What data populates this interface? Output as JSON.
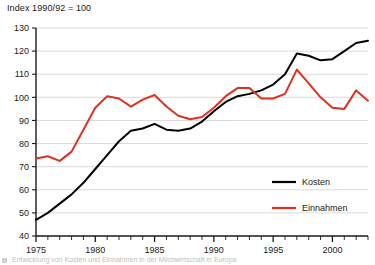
{
  "chart_title": "Index 1990/92 = 100",
  "caption": {
    "bullet_icon": "square-bullet-icon",
    "text": "Entwicklung von Kosten und Einnahmen in der Milchwirtschaft in Europa"
  },
  "axes": {
    "y": {
      "label": "",
      "min": 40,
      "max": 130,
      "step": 10,
      "ticks": [
        40,
        50,
        60,
        70,
        80,
        90,
        100,
        110,
        120,
        130
      ]
    },
    "x": {
      "label": "",
      "min": 1975,
      "max": 2003,
      "major_step": 5,
      "minor_step": 1,
      "labels": [
        1975,
        1980,
        1985,
        1990,
        1995,
        2000
      ]
    }
  },
  "legend": {
    "position": "inside-bottom-right",
    "entries": [
      {
        "name": "Kosten",
        "color": "#000000"
      },
      {
        "name": "Einnahmen",
        "color": "#e0301e"
      }
    ]
  },
  "chart_data": {
    "type": "line",
    "title": "Index 1990/92 = 100",
    "subtitle": "",
    "xlabel": "",
    "ylabel": "",
    "xlim": [
      1975,
      2003
    ],
    "ylim": [
      40,
      130
    ],
    "grid": true,
    "grid_axis": "y",
    "legend_position": "inside-bottom-right",
    "x": [
      1975,
      1976,
      1977,
      1978,
      1979,
      1980,
      1981,
      1982,
      1983,
      1984,
      1985,
      1986,
      1987,
      1988,
      1989,
      1990,
      1991,
      1992,
      1993,
      1994,
      1995,
      1996,
      1997,
      1998,
      1999,
      2000,
      2001,
      2002,
      2003
    ],
    "series": [
      {
        "name": "Kosten",
        "color": "#000000",
        "values": [
          47,
          50,
          54,
          58,
          63,
          69,
          75,
          81,
          85.5,
          86.5,
          88.5,
          86,
          85.5,
          86.5,
          89.5,
          94,
          98,
          100.5,
          101.5,
          103,
          105.5,
          110,
          119,
          118,
          116,
          116.5,
          120,
          123.5,
          124.5
        ]
      },
      {
        "name": "Einnahmen",
        "color": "#e0301e",
        "values": [
          73.5,
          74.5,
          72.5,
          76.5,
          86,
          95.5,
          100.5,
          99.5,
          96,
          99,
          101,
          96,
          92,
          90.5,
          91.5,
          95.5,
          100.5,
          104,
          104,
          99.5,
          99.5,
          101.5,
          112,
          106,
          100,
          95.5,
          95,
          103,
          98.5
        ]
      }
    ]
  }
}
